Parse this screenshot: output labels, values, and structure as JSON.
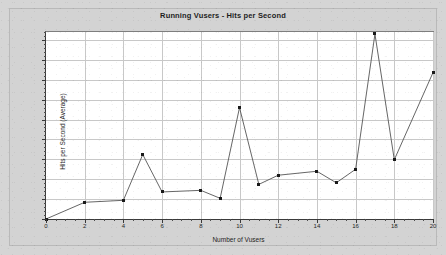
{
  "chart_data": {
    "type": "line",
    "title": "Running Vusers - Hits per Second",
    "xlabel": "Number of Vusers",
    "ylabel": "Hits per Second (Average)",
    "xlim": [
      0,
      20
    ],
    "ylim": [
      0,
      47
    ],
    "grid": true,
    "legend": "none",
    "x_ticks": [
      0,
      2,
      4,
      6,
      8,
      10,
      12,
      14,
      16,
      18,
      20
    ],
    "x_tick_labels": [
      "0",
      "2",
      "4",
      "6",
      "8",
      "10",
      "12",
      "14",
      "16",
      "18",
      "20"
    ],
    "x_minor_tick_step": 0.5,
    "y_ticks": [
      0,
      5,
      10,
      15,
      20,
      25,
      30,
      35,
      40,
      45
    ],
    "y_tick_labels": [
      "0",
      "5",
      "10",
      "15",
      "20",
      "25",
      "30",
      "35",
      "40",
      "45"
    ],
    "series": [
      {
        "name": "Hits per Second",
        "color": "#555555",
        "marker": "square",
        "marker_color": "#1a1a1a",
        "x": [
          0,
          2,
          4,
          5,
          6,
          8,
          9,
          10,
          11,
          12,
          14,
          15,
          16,
          17,
          18,
          20
        ],
        "values": [
          0,
          4.2,
          4.7,
          16.2,
          6.8,
          7.2,
          5.2,
          28.0,
          8.7,
          11.0,
          12.0,
          9.1,
          12.5,
          46.5,
          14.9,
          36.8
        ]
      }
    ]
  },
  "colors": {
    "page_background": "#d5d5d5",
    "plot_background": "#ffffff",
    "grid": "#c8c8c8",
    "axis": "#3a3a3a",
    "line": "#555555",
    "marker": "#1a1a1a",
    "text": "#1d1d1d"
  }
}
